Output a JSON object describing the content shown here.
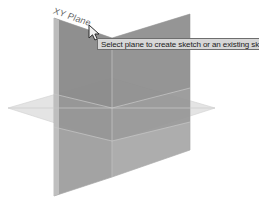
{
  "app": {
    "view_name": "3d-modeling-viewport",
    "background_color": "#ffffff"
  },
  "viewport": {
    "label": "3D modeling viewport"
  },
  "planes": {
    "xy_plane": {
      "label": "XY Plane",
      "fill": "#8a8a8a",
      "edge": "#9a9a9a"
    },
    "yz_plane": {
      "label": "YZ Plane",
      "fill": "#9d9d9d",
      "edge": "#a8a8a8"
    },
    "xz_plane": {
      "label": "XZ Plane",
      "fill": "#e2e2e2",
      "edge": "#d0d0d0"
    },
    "overlap_fill": "#7d7d7d"
  },
  "tooltip": {
    "text": "Select plane to create sketch or an existing sketch to edit",
    "background": "#d7d7d7",
    "border": "#6e6e6e",
    "text_color": "#1b1b1b"
  },
  "cursor": {
    "name": "arrow-pointer",
    "color": "#2a2a2a"
  }
}
